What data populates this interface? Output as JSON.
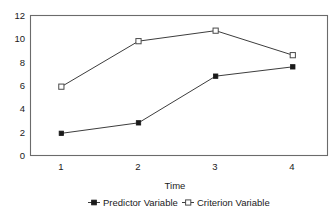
{
  "chart_data": {
    "type": "line",
    "title": "",
    "subtitle": "",
    "xlabel": "Time",
    "ylabel": "",
    "categories": [
      "1",
      "2",
      "3",
      "4"
    ],
    "x": [
      1,
      2,
      3,
      4
    ],
    "xlim": [
      0.6,
      4.45
    ],
    "ylim": [
      0,
      12
    ],
    "yticks": [
      "0",
      "2",
      "4",
      "6",
      "8",
      "10",
      "12"
    ],
    "ytick_values": [
      0,
      2,
      4,
      6,
      8,
      10,
      12
    ],
    "xticks": [
      "1",
      "2",
      "3",
      "4"
    ],
    "grid": false,
    "legend_position": "bottom",
    "frame": true,
    "series": [
      {
        "name": "Predictor Variable",
        "marker": "filled-square",
        "values": [
          1.9,
          2.8,
          6.8,
          7.6
        ]
      },
      {
        "name": "Criterion Variable",
        "marker": "open-square",
        "values": [
          5.9,
          9.8,
          10.7,
          8.6
        ]
      }
    ]
  },
  "legend": {
    "entries": [
      {
        "label": "Predictor Variable",
        "marker_icon": "filled-square-marker"
      },
      {
        "label": "Criterion Variable",
        "marker_icon": "open-square-marker"
      }
    ]
  },
  "axes": {
    "x_title": "Time",
    "y_tick_0": "0",
    "y_tick_1": "2",
    "y_tick_2": "4",
    "y_tick_3": "6",
    "y_tick_4": "8",
    "y_tick_5": "10",
    "y_tick_6": "12",
    "x_tick_0": "1",
    "x_tick_1": "2",
    "x_tick_2": "3",
    "x_tick_3": "4"
  },
  "colors": {
    "line": "#3d3d3d",
    "frame": "#6b6b6b",
    "marker_fill": "#1a1a1a",
    "marker_open_fill": "#ffffff",
    "text": "#1a1a1a",
    "background": "#ffffff"
  }
}
